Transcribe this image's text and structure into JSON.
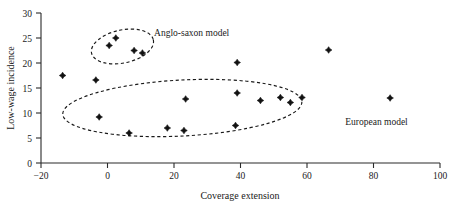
{
  "chart_data": {
    "type": "scatter",
    "title": "",
    "xlabel": "Coverage extension",
    "ylabel": "Low-wage incidence",
    "xlim": [
      -20,
      100
    ],
    "ylim": [
      0,
      30
    ],
    "xticks": [
      -20,
      0,
      20,
      40,
      60,
      80,
      100
    ],
    "yticks": [
      0,
      5,
      10,
      15,
      20,
      25,
      30
    ],
    "xtick_labels": [
      "−20",
      "0",
      "20",
      "40",
      "60",
      "80",
      "100"
    ],
    "ytick_labels": [
      "0",
      "5",
      "10",
      "15",
      "20",
      "25",
      "30"
    ],
    "grid": false,
    "legend": "none",
    "marker": "diamond",
    "marker_color": "#111111",
    "points": [
      {
        "x": -13.5,
        "y": 17.5
      },
      {
        "x": -3.5,
        "y": 16.6
      },
      {
        "x": -2.5,
        "y": 9.2
      },
      {
        "x": 0.5,
        "y": 23.5
      },
      {
        "x": 2.5,
        "y": 25.0
      },
      {
        "x": 6.5,
        "y": 6.0
      },
      {
        "x": 8.0,
        "y": 22.5
      },
      {
        "x": 10.5,
        "y": 22.0
      },
      {
        "x": 18.0,
        "y": 7.0
      },
      {
        "x": 23.0,
        "y": 6.5
      },
      {
        "x": 23.5,
        "y": 12.8
      },
      {
        "x": 38.5,
        "y": 7.5
      },
      {
        "x": 39.0,
        "y": 20.1
      },
      {
        "x": 39.0,
        "y": 14.0
      },
      {
        "x": 46.0,
        "y": 12.5
      },
      {
        "x": 52.0,
        "y": 13.1
      },
      {
        "x": 55.0,
        "y": 12.1
      },
      {
        "x": 58.5,
        "y": 13.1
      },
      {
        "x": 66.5,
        "y": 22.6
      },
      {
        "x": 85.0,
        "y": 13.0
      }
    ],
    "annotations": [
      {
        "name": "anglo-saxon-cluster",
        "label": "Anglo-saxon model",
        "shape": "dashed-ellipse",
        "center": {
          "x": 4.5,
          "y": 23.3
        },
        "radius": {
          "x": 9.5,
          "y": 3.3
        },
        "rotation": -12,
        "label_position": {
          "x": 14.0,
          "y": 25.4
        }
      },
      {
        "name": "european-cluster",
        "label": "European model",
        "shape": "dashed-ellipse",
        "center": {
          "x": 22.5,
          "y": 11.0
        },
        "radius": {
          "x": 36.0,
          "y": 5.6
        },
        "rotation": -3,
        "label_position": {
          "x": 71.5,
          "y": 7.6
        }
      }
    ]
  },
  "axes": {
    "x_axis_name": "coverage-extension-axis",
    "y_axis_name": "low-wage-incidence-axis"
  }
}
